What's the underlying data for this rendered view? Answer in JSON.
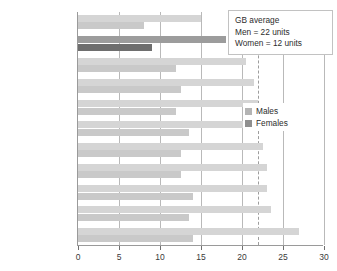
{
  "annotation": {
    "line1": "GB average",
    "line2": "Men = 22 units",
    "line3": "Women = 12 units"
  },
  "legend": {
    "males_label": "Males",
    "females_label": "Females",
    "males_color": "#b4b4b4",
    "females_color": "#8f8f8f"
  },
  "chart_data": {
    "type": "bar",
    "orientation": "horizontal",
    "title": "",
    "xlabel": "",
    "ylabel": "",
    "xlim": [
      0,
      30
    ],
    "xticks": [
      0,
      5,
      10,
      15,
      20,
      25,
      30
    ],
    "grid": true,
    "legend_position": "right",
    "reference_line": 22,
    "highlighted_category": "North East",
    "categories": [
      "Scotland",
      "North East",
      "North West",
      "Wales",
      "Yorkshire and\nThe Humber",
      "East",
      "West Midlands",
      "South West",
      "South East",
      "London",
      "East Midlands"
    ],
    "series": [
      {
        "name": "Males",
        "color": "#d5d5d5",
        "values": [
          15,
          18,
          20.5,
          21.5,
          22,
          22,
          22.5,
          23,
          23,
          23.5,
          27
        ]
      },
      {
        "name": "Females",
        "color": "#c9c9c9",
        "values": [
          8,
          9,
          12,
          12.5,
          12,
          13.5,
          12.5,
          12.5,
          14,
          13.5,
          14
        ]
      }
    ]
  }
}
